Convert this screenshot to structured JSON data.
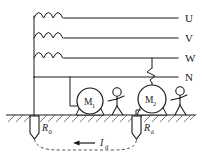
{
  "diagram": {
    "colors": {
      "line": "#1a1a1a",
      "ground_hatch": "#555555",
      "background": "#ffffff",
      "dashed_loop": "#555555"
    },
    "phase_labels": [
      {
        "name": "U",
        "text": "U",
        "y": 18
      },
      {
        "name": "V",
        "text": "V",
        "y": 38
      },
      {
        "name": "W",
        "text": "W",
        "y": 58
      },
      {
        "name": "N",
        "text": "N",
        "y": 77
      }
    ],
    "windings": [
      {
        "name": "winding-u",
        "phase": "U"
      },
      {
        "name": "winding-v",
        "phase": "V"
      },
      {
        "name": "winding-w",
        "phase": "W"
      }
    ],
    "motors": [
      {
        "name": "motor-m1",
        "label": "M",
        "subscript": "1",
        "cx": 90,
        "cy": 101,
        "r": 13
      },
      {
        "name": "motor-m2",
        "label": "M",
        "subscript": "2",
        "cx": 152,
        "cy": 99,
        "r": 14
      }
    ],
    "persons": [
      {
        "name": "person-near-m1",
        "x": 117
      },
      {
        "name": "person-near-m2",
        "x": 180
      }
    ],
    "electrodes": [
      {
        "name": "electrode-r0",
        "label": "R",
        "subscript": "0",
        "x": 34
      },
      {
        "name": "electrode-rd",
        "label": "R",
        "subscript": "d",
        "x": 140
      }
    ],
    "current": {
      "name": "fault-current",
      "label": "I",
      "subscript": "d",
      "direction": "left"
    },
    "fault": {
      "name": "fault-point",
      "description": "zigzag break on W phase feeding motor M2 frame"
    },
    "ground": {
      "name": "earth-surface",
      "y": 115
    }
  }
}
